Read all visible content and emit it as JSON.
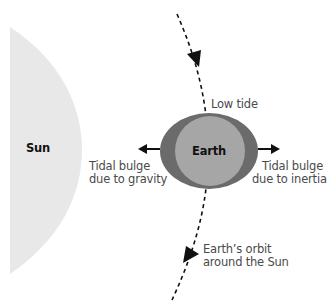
{
  "diagram": {
    "title": "",
    "colors": {
      "sun": "#e8e8e8",
      "earth_outer": "#6b6b6b",
      "earth_inner": "#a6a6a6",
      "line": "#111111",
      "text": "#4a4a4a"
    },
    "labels": {
      "sun": "Sun",
      "earth": "Earth",
      "low_tide": "Low tide",
      "bulge_gravity_line1": "Tidal bulge",
      "bulge_gravity_line2": "due to gravity",
      "bulge_inertia_line1": "Tidal bulge",
      "bulge_inertia_line2": "due to inertia",
      "orbit_line1": "Earth’s orbit",
      "orbit_line2": "around the Sun"
    }
  }
}
